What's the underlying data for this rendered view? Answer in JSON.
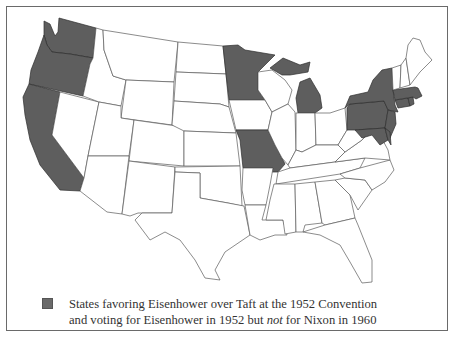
{
  "map": {
    "region": "Contiguous United States",
    "highlight_color": "#5e5e5e",
    "base_color": "#ffffff",
    "highlighted_states": [
      "Washington",
      "Oregon",
      "California",
      "Minnesota",
      "Michigan",
      "Missouri",
      "New York",
      "Pennsylvania",
      "New Jersey",
      "Massachusetts",
      "Connecticut",
      "Rhode Island",
      "Maryland",
      "Delaware"
    ],
    "unhighlighted_states": [
      "Idaho",
      "Montana",
      "Wyoming",
      "Nevada",
      "Utah",
      "Colorado",
      "Arizona",
      "New Mexico",
      "North Dakota",
      "South Dakota",
      "Nebraska",
      "Kansas",
      "Oklahoma",
      "Texas",
      "Iowa",
      "Arkansas",
      "Louisiana",
      "Wisconsin",
      "Illinois",
      "Indiana",
      "Ohio",
      "Kentucky",
      "Tennessee",
      "Mississippi",
      "Alabama",
      "Georgia",
      "Florida",
      "South Carolina",
      "North Carolina",
      "Virginia",
      "West Virginia",
      "Vermont",
      "New Hampshire",
      "Maine"
    ]
  },
  "legend": {
    "swatch_color": "#6a6a6a",
    "line1": "States favoring Eisenhower over Taft at the 1952 Convention",
    "line2_before": "and voting for Eisenhower in 1952 but ",
    "line2_emph": "not",
    "line2_after": " for Nixon in 1960"
  }
}
